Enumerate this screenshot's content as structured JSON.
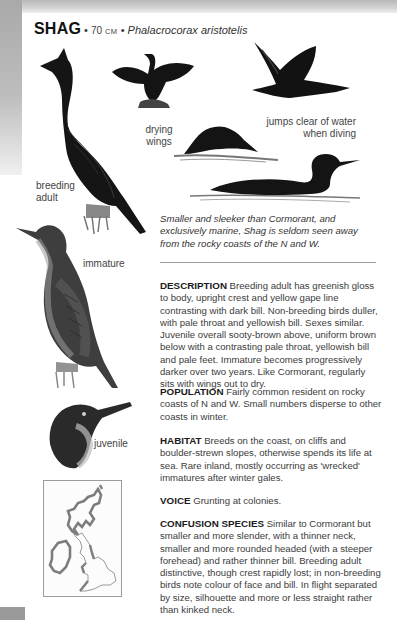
{
  "header": {
    "common_name": "SHAG",
    "separator": " • ",
    "size_value": "70",
    "size_unit": "CM",
    "separator2": " • ",
    "latin_name": "Phalacrocorax aristotelis"
  },
  "illustrations": {
    "labels": {
      "drying_wings_1": "drying",
      "drying_wings_2": "wings",
      "jumps_1": "jumps clear of water",
      "jumps_2": "when diving",
      "breeding_1": "breeding",
      "breeding_2": "adult",
      "immature": "immature",
      "juvenile": "juvenile"
    }
  },
  "caption": "Smaller and sleeker than Cormorant, and exclusively marine, Shag is seldom seen away from the rocky coasts of the N and W.",
  "sections": [
    {
      "heading": "DESCRIPTION",
      "text": " Breeding adult has greenish gloss to body, upright crest and yellow gape line contrasting with dark bill. Non-breeding birds duller, with pale throat and yellowish bill. Sexes similar. Juvenile overall sooty-brown above, uniform brown below with a contrasting pale throat, yellowish bill and pale feet. Immature becomes progressively darker over two years. Like Cormorant, regularly sits with wings out to dry."
    },
    {
      "heading": "POPULATION",
      "text": " Fairly common resident on rocky coasts of N and W. Small numbers disperse to other coasts in winter."
    },
    {
      "heading": "HABITAT",
      "text": " Breeds on the coast, on cliffs and boulder-strewn slopes, otherwise spends its life at sea. Rare inland, mostly occurring as 'wrecked' immatures after winter gales."
    },
    {
      "heading": "VOICE",
      "text": " Grunting at colonies."
    },
    {
      "heading": "CONFUSION SPECIES",
      "text": " Similar to Cormorant but smaller and more slender, with a thinner neck, smaller and more rounded headed (with a steeper forehead) and rather thinner bill. Breeding adult distinctive, though crest rapidly lost; in non-breeding birds note colour of face and bill. In flight separated by size, silhouette and more or less straight rather than kinked neck."
    }
  ],
  "map": {
    "region": "Britain and Ireland distribution map"
  },
  "colors": {
    "text": "#3c3c3c",
    "heading": "#1a1a1a",
    "bird_dark": "#141414",
    "map_range": "#8a8a8a",
    "tab": "#9a9a9a"
  }
}
